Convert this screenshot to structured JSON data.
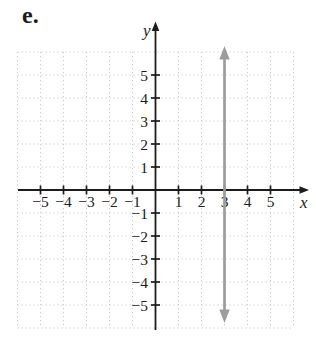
{
  "figure": {
    "label": "e."
  },
  "chart_data": {
    "type": "line",
    "subtype": "vertical-line-graph",
    "title": "",
    "xlabel": "x",
    "ylabel": "y",
    "xlim": [
      -6,
      6
    ],
    "ylim": [
      -6,
      6
    ],
    "x_ticks": [
      -5,
      -4,
      -3,
      -2,
      -1,
      1,
      2,
      3,
      4,
      5
    ],
    "y_ticks": [
      -5,
      -4,
      -3,
      -2,
      -1,
      1,
      2,
      3,
      4,
      5
    ],
    "grid": true,
    "grid_style": "dotted",
    "series": [
      {
        "name": "graphed line",
        "equation": "x = 3",
        "orientation": "vertical",
        "x": 3,
        "y_span": [
          -6,
          6
        ],
        "arrows": "both",
        "color": "#9b9d9d"
      }
    ],
    "colors": {
      "axis": "#1c1c1c",
      "grid": "#c6cad2",
      "tick_label": "#1c1c1c",
      "background": "#ffffff"
    }
  }
}
